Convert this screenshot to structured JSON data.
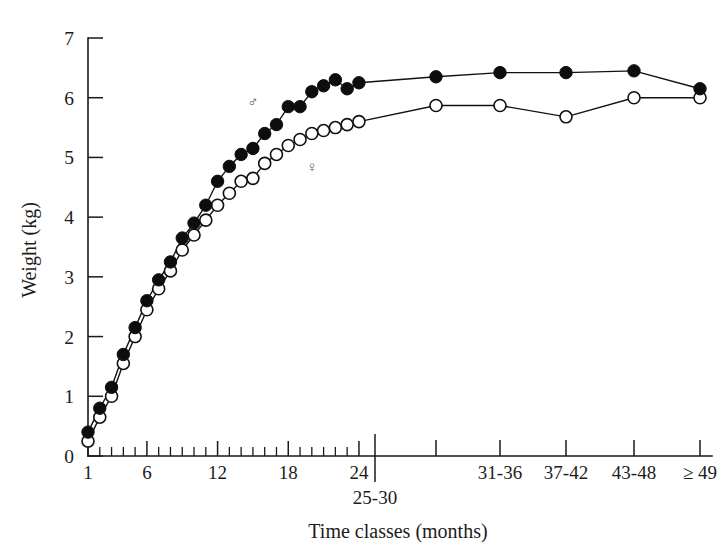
{
  "figure": {
    "name": "growth-curve-weight-by-time-class",
    "background_color": "#ffffff",
    "ink_color": "#111111"
  },
  "chart_data": {
    "type": "line",
    "title": "",
    "subtitle": "",
    "xlabel": "Time classes (months)",
    "ylabel": "Weight (kg)",
    "ylim": [
      0,
      7
    ],
    "xlim": [
      0,
      30
    ],
    "grid": false,
    "legend_position": "inline-annotations",
    "y_ticks": [
      0,
      1,
      2,
      3,
      4,
      5,
      6,
      7
    ],
    "y_tick_labels": [
      "0",
      "1",
      "2",
      "3",
      "4",
      "5",
      "6",
      "7"
    ],
    "x_tick_labels_shown": [
      "1",
      "6",
      "12",
      "18",
      "24"
    ],
    "x_class_labels": [
      "25-30",
      "31-36",
      "37-42",
      "43-48",
      "≥ 49"
    ],
    "x_categories": [
      "1",
      "2",
      "3",
      "4",
      "5",
      "6",
      "7",
      "8",
      "9",
      "10",
      "11",
      "12",
      "13",
      "14",
      "15",
      "16",
      "17",
      "18",
      "19",
      "20",
      "21",
      "22",
      "23",
      "24",
      "25-30",
      "31-36",
      "37-42",
      "43-48",
      "≥ 49"
    ],
    "annotations": [
      {
        "symbol": "♂",
        "meaning": "male",
        "x_index": 14,
        "y_value": 5.85
      },
      {
        "symbol": "♀",
        "meaning": "female",
        "x_index": 19,
        "y_value": 4.75
      }
    ],
    "series": [
      {
        "name": "Males",
        "symbol": "♂",
        "marker": "filled-circle",
        "marker_fill": "#0d0d0d",
        "values": [
          0.4,
          0.8,
          1.15,
          1.7,
          2.15,
          2.6,
          2.95,
          3.25,
          3.65,
          3.9,
          4.2,
          4.6,
          4.85,
          5.05,
          5.15,
          5.4,
          5.55,
          5.85,
          5.85,
          6.1,
          6.2,
          6.3,
          6.15,
          6.25,
          6.35,
          6.42,
          6.42,
          6.45,
          6.15
        ]
      },
      {
        "name": "Females",
        "symbol": "♀",
        "marker": "open-circle",
        "marker_fill": "#ffffff",
        "values": [
          0.25,
          0.65,
          1.0,
          1.55,
          2.0,
          2.45,
          2.8,
          3.1,
          3.45,
          3.7,
          3.95,
          4.2,
          4.4,
          4.6,
          4.65,
          4.9,
          5.05,
          5.2,
          5.3,
          5.4,
          5.45,
          5.5,
          5.55,
          5.6,
          5.87,
          5.87,
          5.68,
          6.0,
          6.0
        ]
      }
    ]
  },
  "axes": {
    "y_axis_title": "Weight (kg)",
    "x_axis_title": "Time classes (months)"
  },
  "corner": {
    "mark": ""
  }
}
